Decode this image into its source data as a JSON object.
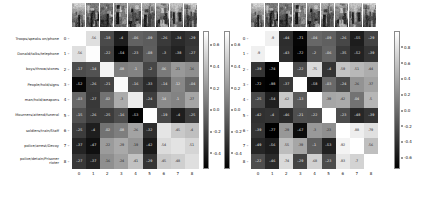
{
  "figure": {
    "background": "#ffffff",
    "colormap": "gray"
  },
  "chart_data": [
    {
      "type": "heatmap",
      "panel": "left",
      "title": "",
      "xlabel": "",
      "ylabel": "",
      "grid": false,
      "legend_position": "right",
      "colorbar": {
        "ticks": [
          "0.6",
          "0.4",
          "0.2",
          "0.0",
          "-0.2",
          "-0.4"
        ],
        "vmin": -0.55,
        "vmax": 0.72
      },
      "x_tick_labels": [
        "0",
        "1",
        "2",
        "3",
        "4",
        "5",
        "6",
        "7",
        "8"
      ],
      "y_tick_labels": [
        "0",
        "1",
        "2",
        "3",
        "4",
        "5",
        "6",
        "7",
        "8"
      ],
      "row_labels": [
        "Troops/speaks on/phone",
        "Donald/talks/telephone",
        "boys/throw/stones",
        "People/hold/signs",
        "man/hold/weapons",
        "Mourners/attend/funeral",
        "soldiers/train/Staff",
        "police/arrest/Decoy",
        "police/detain/Prisoner\nrioter"
      ],
      "values": [
        [
          0.72,
          0.56,
          -0.18,
          -0.4,
          -0.06,
          -0.09,
          -0.26,
          -0.34,
          -0.29
        ],
        [
          0.56,
          0.71,
          -0.22,
          -0.54,
          -0.23,
          -0.08,
          -0.3,
          -0.38,
          -0.27
        ],
        [
          -0.17,
          -0.14,
          0.66,
          0.08,
          0.1,
          -0.2,
          0.06,
          0.21,
          0.16
        ],
        [
          -0.52,
          -0.26,
          -0.21,
          0.7,
          -0.16,
          -0.33,
          -0.14,
          0.12,
          -0.04
        ],
        [
          -0.03,
          -0.27,
          0.02,
          0.3,
          0.62,
          -0.24,
          0.14,
          0.1,
          0.27
        ],
        [
          -0.15,
          -0.26,
          -0.25,
          -0.16,
          -0.53,
          0.74,
          -0.19,
          -0.4,
          -0.25
        ],
        [
          -0.25,
          -0.4,
          0.02,
          0.08,
          0.26,
          -0.32,
          0.59,
          0.45,
          0.4
        ],
        [
          -0.37,
          -0.47,
          0.22,
          0.29,
          0.19,
          -0.42,
          0.54,
          0.58,
          0.51
        ],
        [
          -0.27,
          -0.37,
          0.16,
          0.24,
          0.41,
          -0.29,
          0.45,
          0.48,
          0.56
        ]
      ]
    },
    {
      "type": "heatmap",
      "panel": "right",
      "title": "",
      "xlabel": "",
      "ylabel": "",
      "grid": false,
      "legend_position": "both",
      "colorbar": {
        "ticks": [
          "0.8",
          "0.6",
          "0.4",
          "0.2",
          "0.0",
          "-0.2",
          "-0.4",
          "-0.6"
        ],
        "vmin": -0.75,
        "vmax": 1.0
      },
      "x_tick_labels": [
        "0",
        "1",
        "2",
        "3",
        "4",
        "5",
        "6",
        "7",
        "8"
      ],
      "y_tick_labels": [
        "0",
        "1",
        "2",
        "3",
        "4",
        "5",
        "6",
        "7",
        "8"
      ],
      "values": [
        [
          1.0,
          0.9,
          -0.44,
          -0.71,
          -0.04,
          -0.09,
          -0.26,
          -0.55,
          -0.29
        ],
        [
          0.9,
          1.0,
          -0.43,
          -0.72,
          -0.2,
          -0.06,
          -0.35,
          -0.52,
          -0.39
        ],
        [
          -0.39,
          -0.74,
          1.0,
          -0.22,
          0.75,
          -0.4,
          0.59,
          0.51,
          0.44
        ],
        [
          -0.72,
          -0.98,
          -0.37,
          1.0,
          -0.58,
          -0.03,
          -0.24,
          0.26,
          0.37
        ],
        [
          -0.25,
          -0.54,
          0.62,
          -0.13,
          1.0,
          0.39,
          0.42,
          0.04,
          0.5
        ],
        [
          -0.42,
          -0.4,
          -0.46,
          -0.21,
          -0.22,
          1.0,
          -0.23,
          -0.48,
          -0.39
        ],
        [
          -0.39,
          -0.77,
          0.29,
          -0.67,
          0.3,
          0.23,
          1.0,
          0.88,
          0.79
        ],
        [
          -0.49,
          -0.56,
          0.55,
          0.39,
          -0.1,
          -0.53,
          0.92,
          1.0,
          0.56
        ],
        [
          -0.22,
          -0.46,
          0.74,
          -0.29,
          0.68,
          -0.23,
          0.83,
          0.7,
          1.0
        ]
      ]
    }
  ],
  "thumbnails": {
    "count": 9,
    "alt_names": [
      "thumbnail-0",
      "thumbnail-1",
      "thumbnail-2",
      "thumbnail-3",
      "thumbnail-4",
      "thumbnail-5",
      "thumbnail-6",
      "thumbnail-7",
      "thumbnail-8"
    ]
  }
}
